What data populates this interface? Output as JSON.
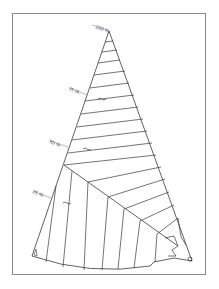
{
  "diagram": {
    "type": "fan-shaped hatched sector drawing",
    "labels": {
      "p100": "100 %",
      "p75": "75 %",
      "p50": "50 %",
      "p25": "25 %"
    },
    "colors": {
      "line": "#3a3a3a",
      "frame": "#8a8a8a",
      "background": "#ffffff"
    }
  }
}
